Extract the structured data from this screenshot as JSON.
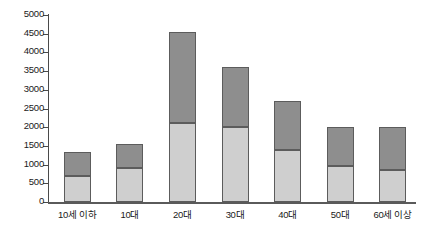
{
  "chart_data": {
    "type": "bar",
    "subtype": "stacked-vertical",
    "title": "",
    "xlabel": "",
    "ylabel": "",
    "categories": [
      "10세 이하",
      "10대",
      "20대",
      "30대",
      "40대",
      "50대",
      "60세 이상"
    ],
    "series": [
      {
        "name": "lower",
        "color": "#cfcfcf",
        "values": [
          700,
          900,
          2100,
          2000,
          1400,
          950,
          850
        ]
      },
      {
        "name": "upper",
        "color": "#8e8e8e",
        "values": [
          650,
          650,
          2450,
          1600,
          1300,
          1050,
          1150
        ]
      }
    ],
    "totals": [
      1350,
      1550,
      4550,
      3600,
      2700,
      2000,
      2000
    ],
    "ylim": [
      0,
      5000
    ],
    "yticks": [
      0,
      500,
      1000,
      1500,
      2000,
      2500,
      3000,
      3500,
      4000,
      4500,
      5000
    ],
    "ytick_labels": [
      "0",
      "500",
      "1000",
      "1500",
      "2000",
      "2500",
      "3000",
      "3500",
      "4000",
      "4500",
      "5000"
    ],
    "grid": false,
    "legend": "none",
    "axis_color": "#4a4a4a",
    "background": "#ffffff"
  }
}
